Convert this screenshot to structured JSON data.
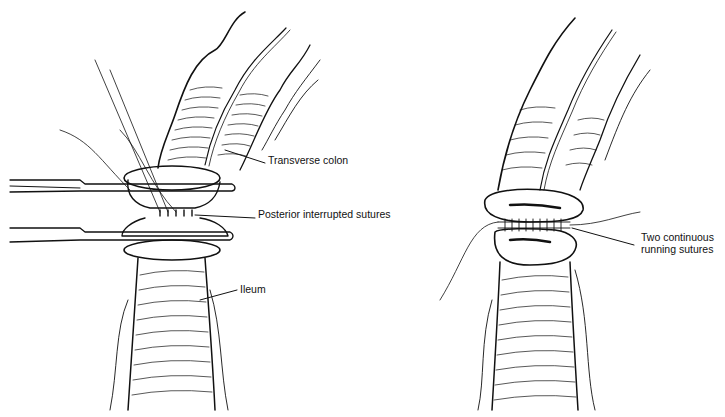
{
  "figure": {
    "panels": [
      {
        "id": "left",
        "description": "Posterior layer of ileocolic anastomosis with clamps applied",
        "labels": [
          {
            "text": "Transverse colon",
            "x": 268,
            "y": 160
          },
          {
            "text": "Posterior interrupted sutures",
            "x": 258,
            "y": 214
          },
          {
            "text": "Ileum",
            "x": 240,
            "y": 287
          }
        ]
      },
      {
        "id": "right",
        "description": "Completed anastomosis with running sutures",
        "labels": [
          {
            "text": "Two continuous\nrunning sutures",
            "x": 641,
            "y": 238
          }
        ]
      }
    ],
    "colors": {
      "line": "#111111",
      "background": "#ffffff"
    }
  }
}
